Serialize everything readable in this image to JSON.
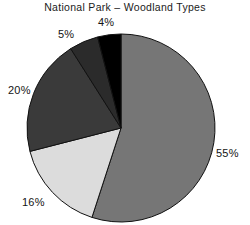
{
  "chart_data": {
    "type": "pie",
    "title": "National Park – Woodland Types",
    "xlabel": "",
    "ylabel": "",
    "legend": "none",
    "grid": false,
    "start_angle_deg": 0,
    "direction": "clockwise",
    "categories": [
      "55%",
      "16%",
      "20%",
      "5%",
      "4%"
    ],
    "values": [
      55,
      16,
      20,
      5,
      4
    ],
    "labels": [
      "55%",
      "16%",
      "20%",
      "5%",
      "4%"
    ],
    "colors": [
      "#767676",
      "#dcdcdc",
      "#3a3a3a",
      "#2b2b2b",
      "#000000"
    ],
    "slices": [
      {
        "label": "55%",
        "value": 55,
        "color": "#767676"
      },
      {
        "label": "16%",
        "value": 16,
        "color": "#dcdcdc"
      },
      {
        "label": "20%",
        "value": 20,
        "color": "#3a3a3a"
      },
      {
        "label": "5%",
        "value": 5,
        "color": "#2b2b2b"
      },
      {
        "label": "4%",
        "value": 4,
        "color": "#000000"
      }
    ],
    "total": 100,
    "units": "percent"
  },
  "geometry": {
    "cx": 121,
    "cy": 128,
    "r": 94,
    "stroke": "#111111",
    "stroke_width": 1
  }
}
